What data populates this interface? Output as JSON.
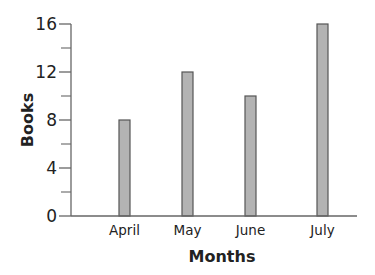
{
  "chart_data": {
    "type": "bar",
    "title": "",
    "xlabel": "Months",
    "ylabel": "Books",
    "categories": [
      "April",
      "May",
      "June",
      "July"
    ],
    "values": [
      8,
      12,
      10,
      16
    ],
    "ylim": [
      0,
      16
    ],
    "y_major_ticks": [
      0,
      4,
      8,
      12,
      16
    ],
    "y_minor_ticks": [
      2,
      6,
      10,
      14
    ],
    "grid": false,
    "legend": null
  },
  "colors": {
    "bar_fill": "#b3b3b3",
    "bar_stroke": "#555555",
    "axis": "#666666",
    "text": "#222222"
  }
}
